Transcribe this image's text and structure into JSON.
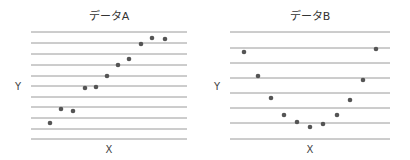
{
  "chart_data": [
    {
      "type": "scatter",
      "title": "データA",
      "xlabel": "X",
      "ylabel": "Y",
      "grid": "horizontal",
      "points_px": [
        [
          50,
          123
        ],
        [
          61,
          109
        ],
        [
          73,
          111
        ],
        [
          85,
          88
        ],
        [
          96,
          87
        ],
        [
          107,
          76
        ],
        [
          118,
          65
        ],
        [
          129,
          59
        ],
        [
          141,
          44
        ],
        [
          152,
          38
        ],
        [
          165,
          39
        ]
      ],
      "x": [
        1,
        2,
        3,
        4,
        5,
        6,
        7,
        8,
        9,
        10,
        11
      ],
      "y": [
        1.5,
        2.8,
        2.6,
        4.7,
        4.8,
        5.8,
        6.8,
        7.3,
        8.7,
        9.3,
        9.2
      ],
      "gridlines_px": [
        32,
        43,
        54,
        65,
        76,
        86,
        97,
        107,
        118,
        129,
        139
      ],
      "x_range_px": [
        31,
        187
      ]
    },
    {
      "type": "scatter",
      "title": "データB",
      "xlabel": "X",
      "ylabel": "Y",
      "grid": "horizontal",
      "points_px": [
        [
          244,
          52
        ],
        [
          258,
          76
        ],
        [
          271,
          98
        ],
        [
          284,
          115
        ],
        [
          297,
          122
        ],
        [
          310,
          127
        ],
        [
          323,
          124
        ],
        [
          337,
          115
        ],
        [
          350,
          100
        ],
        [
          363,
          80
        ],
        [
          376,
          49
        ]
      ],
      "x": [
        1,
        2,
        3,
        4,
        5,
        6,
        7,
        8,
        9,
        10,
        11
      ],
      "y": [
        5.7,
        4.1,
        2.7,
        1.6,
        1.1,
        0.8,
        1.0,
        1.6,
        2.6,
        3.9,
        5.9
      ],
      "gridlines_px": [
        32,
        48,
        63,
        78,
        93,
        108,
        123,
        139
      ],
      "x_range_px": [
        230,
        390
      ]
    }
  ],
  "colors": {
    "grid": "#9a9a9a",
    "point": "#555555",
    "text": "#333333"
  }
}
